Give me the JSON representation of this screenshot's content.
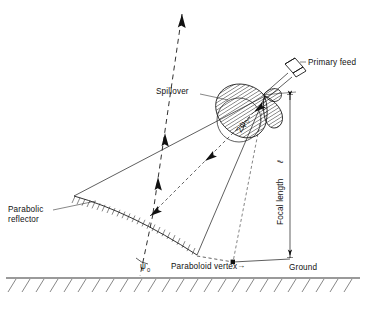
{
  "figure": {
    "background_color": "#ffffff",
    "line_color": "#111111",
    "width": 365,
    "height": 309
  },
  "labels": {
    "primary_feed": "Primary feed",
    "spillover": "Spillover",
    "parabolic_reflector_line1": "Parabolic",
    "parabolic_reflector_line2": "reflector",
    "focal_length": "Focal length",
    "focal_length_symbol": "ℓ",
    "paraboloid_vertex": "Paraboloid vertex",
    "vertex_arrow": "→",
    "ground": "Ground",
    "psi_symbol": "ψ",
    "psi_subscript": "0",
    "two_psi_prefix": "2",
    "two_psi_symbol": "ψ",
    "two_psi_subscript": "0"
  },
  "elements": {
    "feed_horn": "primary-feed-horn",
    "radiation_lobe": "spillover-radiation-lobe",
    "reflector_surface": "parabolic-reflector-surface",
    "ground_line": "ground-hatched-line",
    "beam_ray": "collimated-beam-ray",
    "feed_ray": "feed-to-reflector-ray",
    "dimension_focal": "focal-length-dimension",
    "vertex_marker": "paraboloid-vertex-marker",
    "angle_arc_psi": "psi-zero-angle-arc",
    "angle_arc_two_psi": "two-psi-zero-subtended-angle-arc"
  }
}
